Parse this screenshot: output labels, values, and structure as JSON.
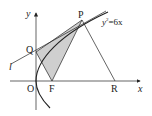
{
  "diagram": {
    "curve_equation": "y²=6x",
    "curve_eq_parts": {
      "base": "y",
      "sup": "2",
      "rest": "=6x"
    },
    "axes": {
      "x_label": "x",
      "y_label": "y",
      "origin_label": "O"
    },
    "points": {
      "P": "P",
      "Q": "Q",
      "F": "F",
      "R": "R"
    },
    "line_label": "l",
    "shaded_region": "triangle QFP",
    "colors": {
      "ink": "#222222",
      "shade": "#cfcfcf"
    }
  }
}
